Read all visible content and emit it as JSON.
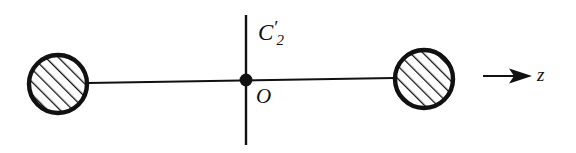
{
  "figure": {
    "kind": "molecular-symmetry-diagram",
    "background_color": "#ffffff",
    "ink_color": "#111111"
  },
  "labels": {
    "rotation_axis": {
      "symbol": "C",
      "prime": "′",
      "subscript": "2",
      "full": "C′₂"
    },
    "origin": "O",
    "axis_z": "z"
  },
  "geometry": {
    "canvas": {
      "width": 576,
      "height": 153
    },
    "atoms": [
      {
        "name": "left-atom",
        "cx": 58,
        "cy": 84,
        "r": 30,
        "hatched": true
      },
      {
        "name": "right-atom",
        "cx": 424,
        "cy": 79,
        "r": 30,
        "hatched": true
      }
    ],
    "bond": {
      "x1": 88,
      "y1": 83,
      "x2": 394,
      "y2": 78
    },
    "center_point": {
      "cx": 246,
      "cy": 80,
      "r": 6
    },
    "vertical_axis": {
      "x": 246,
      "y1": 15,
      "y2": 145
    },
    "z_arrow": {
      "x1": 483,
      "y1": 76,
      "x2": 531,
      "y2": 76
    }
  },
  "style": {
    "hatch_count": 8,
    "hatch_angle_deg": 45,
    "circle_stroke_width": 4,
    "bond_stroke_width": 2,
    "axis_stroke_width": 2.4
  }
}
